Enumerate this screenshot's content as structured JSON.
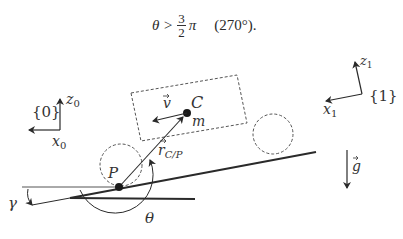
{
  "equation": {
    "lhs": "θ >",
    "numerator": "3",
    "denominator": "2",
    "symbol": "π",
    "degrees": "(270°)."
  },
  "frames": {
    "frame0": {
      "label": "{0}",
      "z": "z",
      "z_sub": "0",
      "x": "x",
      "x_sub": "0"
    },
    "frame1": {
      "label": "{1}",
      "z": "z",
      "z_sub": "1",
      "x": "x",
      "x_sub": "1"
    }
  },
  "body": {
    "center_label": "C",
    "mass_label": "m",
    "velocity_label": "v",
    "contact_label": "P",
    "position_vector_label": "r",
    "position_vector_sub": "C/P"
  },
  "angles": {
    "slope": "γ",
    "theta": "θ"
  },
  "gravity_label": "g",
  "colors": {
    "ink": "#2a2a2a",
    "dashed": "#555555",
    "background": "#ffffff"
  }
}
